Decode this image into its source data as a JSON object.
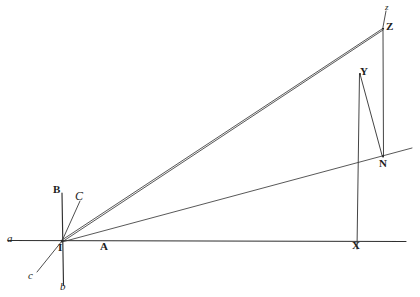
{
  "figure": {
    "type": "geometric-diagram",
    "width": 420,
    "height": 297,
    "background_color": "#ffffff",
    "ink_color": "#2b2b2b"
  },
  "labels": {
    "a_axis_left": "a",
    "b_axis_down": "b",
    "c_axis_down_left": "c",
    "A_point": "A",
    "B_point": "B",
    "C_point": "C",
    "I_origin": "I",
    "X_point": "X",
    "Y_point": "Y",
    "N_point": "N",
    "Z_point": "Z",
    "z_small": "z"
  },
  "geometry": {
    "points": {
      "I": {
        "x": 62,
        "y": 241,
        "label": "I"
      },
      "A": {
        "x": 105,
        "y": 246,
        "label": "A"
      },
      "a": {
        "x": 10,
        "y": 240,
        "label": "a"
      },
      "B": {
        "x": 57,
        "y": 190,
        "label": "B"
      },
      "b": {
        "x": 62,
        "y": 288,
        "label": "b"
      },
      "C": {
        "x": 78,
        "y": 196,
        "label": "C"
      },
      "c": {
        "x": 32,
        "y": 277,
        "label": "c"
      },
      "X": {
        "x": 357,
        "y": 244,
        "label": "X"
      },
      "Y": {
        "x": 360,
        "y": 73,
        "label": "Y"
      },
      "N": {
        "x": 383,
        "y": 155,
        "label": "N"
      },
      "Z": {
        "x": 383,
        "y": 28,
        "label": "Z"
      }
    },
    "segments": [
      {
        "name": "horizontal-axis",
        "from": "a",
        "to": "right-edge",
        "x1": 8,
        "y1": 240,
        "x2": 406,
        "y2": 241
      },
      {
        "name": "vertical-axis",
        "from": "B",
        "to": "b",
        "x1": 62,
        "y1": 193,
        "x2": 63,
        "y2": 285
      },
      {
        "name": "oblique-axis-c",
        "from": "I",
        "to": "c",
        "x1": 62,
        "y1": 241,
        "x2": 38,
        "y2": 272
      },
      {
        "name": "short-ray-C",
        "from": "I",
        "to": "C",
        "x1": 62,
        "y1": 241,
        "x2": 81,
        "y2": 201
      },
      {
        "name": "ray-I-Z",
        "from": "I",
        "to": "Z",
        "x1": 62,
        "y1": 241,
        "x2": 382,
        "y2": 29
      },
      {
        "name": "ray-I-Y-Z",
        "from": "I",
        "to": "Z-via-Y",
        "x1": 62,
        "y1": 241,
        "x2": 383,
        "y2": 29
      },
      {
        "name": "ray-I-N-extended",
        "from": "I",
        "to": "beyond-N",
        "x1": 62,
        "y1": 241,
        "x2": 412,
        "y2": 148
      },
      {
        "name": "segment-Y-X",
        "from": "Y",
        "to": "X",
        "x1": 359,
        "y1": 74,
        "x2": 357,
        "y2": 248
      },
      {
        "name": "segment-Z-N",
        "from": "Z",
        "to": "N",
        "x1": 383,
        "y1": 29,
        "x2": 383,
        "y2": 157
      },
      {
        "name": "segment-Y-N",
        "from": "Y",
        "to": "N",
        "x1": 360,
        "y1": 74,
        "x2": 382,
        "y2": 157
      },
      {
        "name": "segment-z-tick-top",
        "from": "z",
        "to": "Z",
        "x1": 385,
        "y1": 10,
        "x2": 383,
        "y2": 27
      }
    ]
  }
}
